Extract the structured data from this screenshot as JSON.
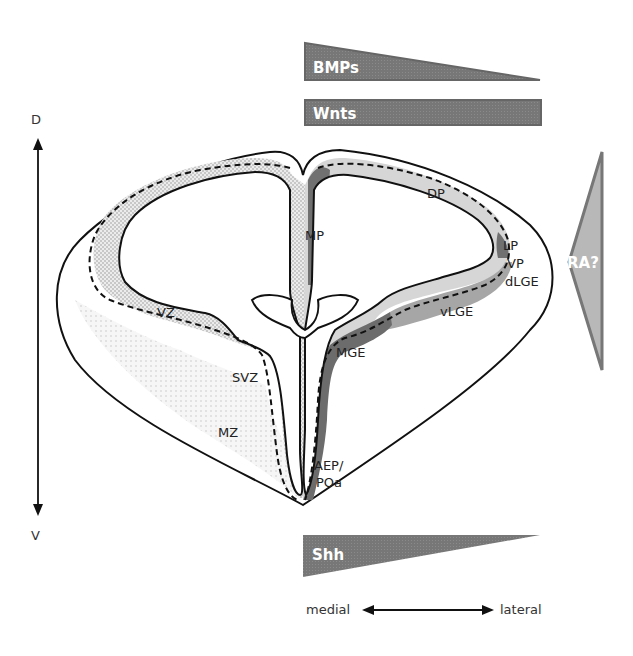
{
  "axes": {
    "dorsal_label": "D",
    "ventral_label": "V",
    "medial_label": "medial",
    "lateral_label": "lateral"
  },
  "gradients": {
    "bmps": {
      "label": "BMPs",
      "shape": "wedge-decreasing-lateral",
      "color": "#7a7a7a"
    },
    "wnts": {
      "label": "Wnts",
      "shape": "bar-uniform",
      "color": "#7a7a7a"
    },
    "shh": {
      "label": "Shh",
      "shape": "wedge-decreasing-lateral",
      "color": "#7a7a7a"
    },
    "ra": {
      "label": "RA?",
      "shape": "wedge-pointing-medial",
      "color": "#b4b4b4"
    }
  },
  "regions": {
    "mp": "MP",
    "dp": "DP",
    "lp": "LP",
    "vp": "VP",
    "dlge": "dLGE",
    "vlge": "vLGE",
    "mge": "MGE",
    "aep_line1": "AEP/",
    "aep_line2": "POa",
    "vz": "VZ",
    "svz": "SVZ",
    "mz": "MZ"
  },
  "colors": {
    "dark_domain": "#6e6e6e",
    "mid_domain": "#a8a8a8",
    "light_domain": "#d9d9d9",
    "stipple": "#c8c8c8"
  }
}
